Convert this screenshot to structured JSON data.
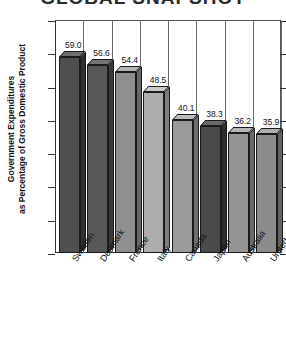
{
  "chart_data": {
    "type": "bar",
    "title": "GLOBAL SNAPSHOT",
    "xlabel": "",
    "ylabel": "Government Expenditures as Percentage of Gross Domestic Product",
    "ylabel_line1": "Government Expenditures",
    "ylabel_line2": "as Percentage of Gross Domestic Product",
    "categories": [
      "Sweden",
      "Denmark",
      "France",
      "Italy",
      "Canada",
      "Japan",
      "Australia",
      "United States"
    ],
    "values": [
      59.0,
      56.6,
      54.4,
      48.5,
      40.1,
      38.3,
      36.2,
      35.9
    ],
    "value_labels": [
      "59.0",
      "56.6",
      "54.4",
      "48.5",
      "40.1",
      "38.3",
      "36.2",
      "35.9"
    ],
    "bar_colors": [
      "#4f4f4f",
      "#585858",
      "#8f8f8f",
      "#adadad",
      "#9a9a9a",
      "#4a4a4a",
      "#949494",
      "#8c8c8c"
    ],
    "bar_top_colors": [
      "#6e6e6e",
      "#757575",
      "#b4b4b4",
      "#cacaca",
      "#bcbcbc",
      "#6a6a6a",
      "#b6b6b6",
      "#afafaf"
    ],
    "bar_side_colors": [
      "#303030",
      "#383838",
      "#676767",
      "#7d7d7d",
      "#6e6e6e",
      "#2e2e2e",
      "#6a6a6a",
      "#646464"
    ],
    "ylim": [
      0,
      70
    ],
    "yticks": [
      0,
      10,
      20,
      30,
      40,
      50,
      60,
      70
    ],
    "ytick_labels": [
      "0",
      "10",
      "20",
      "30",
      "40",
      "50",
      "60",
      "70"
    ],
    "grid": "vertical-category-separators",
    "legend": "none"
  }
}
